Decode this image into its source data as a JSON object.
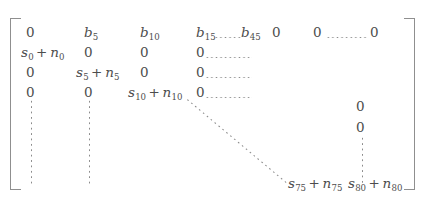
{
  "figure": {
    "type": "matrix",
    "bracket_left": "[",
    "bracket_right": "]"
  },
  "matrix": {
    "rows": [
      {
        "name": "row-1",
        "cells": [
          {
            "name": "cell-r1c1",
            "text": "0"
          },
          {
            "name": "cell-r1c2",
            "base": "b",
            "sub": "5"
          },
          {
            "name": "cell-r1c3",
            "base": "b",
            "sub": "10"
          },
          {
            "name": "cell-r1c4",
            "base": "b",
            "sub": "15"
          },
          {
            "name": "cell-r1c5",
            "base": "b",
            "sub": "45"
          },
          {
            "name": "cell-r1c6",
            "text": "0"
          },
          {
            "name": "cell-r1c7",
            "text": "0"
          },
          {
            "name": "cell-r1c8",
            "text": "0"
          }
        ]
      },
      {
        "name": "row-2",
        "cells": [
          {
            "name": "cell-r2c1",
            "base": "s",
            "sub": "0",
            "op": "+",
            "base2": "n",
            "sub2": "0"
          },
          {
            "name": "cell-r2c2",
            "text": "0"
          },
          {
            "name": "cell-r2c3",
            "text": "0"
          },
          {
            "name": "cell-r2c4",
            "text": "0"
          }
        ]
      },
      {
        "name": "row-3",
        "cells": [
          {
            "name": "cell-r3c1",
            "text": "0"
          },
          {
            "name": "cell-r3c2",
            "base": "s",
            "sub": "5",
            "op": "+",
            "base2": "n",
            "sub2": "5"
          },
          {
            "name": "cell-r3c3",
            "text": "0"
          },
          {
            "name": "cell-r3c4",
            "text": "0"
          }
        ]
      },
      {
        "name": "row-4",
        "cells": [
          {
            "name": "cell-r4c1",
            "text": "0"
          },
          {
            "name": "cell-r4c2",
            "text": "0"
          },
          {
            "name": "cell-r4c3",
            "base": "s",
            "sub": "10",
            "op": "+",
            "base2": "n",
            "sub2": "10"
          },
          {
            "name": "cell-r4c4",
            "text": "0"
          }
        ]
      },
      {
        "name": "row-last",
        "cells": [
          {
            "name": "cell-last-c7",
            "base": "s",
            "sub": "75",
            "op": "+",
            "base2": "n",
            "sub2": "75"
          },
          {
            "name": "cell-last-c8",
            "base": "s",
            "sub": "80",
            "op": "+",
            "base2": "n",
            "sub2": "80"
          }
        ]
      }
    ],
    "right_column_zeros": [
      {
        "name": "cell-rc-zero-1",
        "text": "0"
      },
      {
        "name": "cell-rc-zero-2",
        "text": "0"
      }
    ]
  },
  "symbols": {
    "plus": "+",
    "zero": "0",
    "b": "b",
    "s": "s",
    "n": "n"
  },
  "colors": {
    "ink": "#4d4d4d",
    "dots": "#8b8b8b",
    "bracket": "#8f8f8f",
    "background": "#ffffff"
  }
}
